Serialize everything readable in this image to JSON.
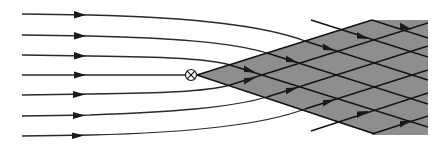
{
  "diagram": {
    "colors": {
      "line": "#2a2a2a",
      "shaded_region": "#8e8e8e",
      "background": "#ffffff"
    },
    "symbols": {
      "source_marker": "⊗"
    },
    "incoming_lines": [
      {
        "start_y": 14,
        "direction": "right"
      },
      {
        "start_y": 35,
        "direction": "right"
      },
      {
        "start_y": 55,
        "direction": "right"
      },
      {
        "start_y": 75,
        "direction": "right"
      },
      {
        "start_y": 95,
        "direction": "right"
      },
      {
        "start_y": 116,
        "direction": "right"
      },
      {
        "start_y": 136,
        "direction": "right"
      }
    ],
    "source_point": {
      "x": 191,
      "y": 75
    },
    "shaded_wedge": {
      "apex": [
        197,
        75
      ],
      "top_corner": [
        372,
        20
      ],
      "right_edge_x": 428,
      "bottom_corner": [
        375,
        134
      ]
    }
  }
}
